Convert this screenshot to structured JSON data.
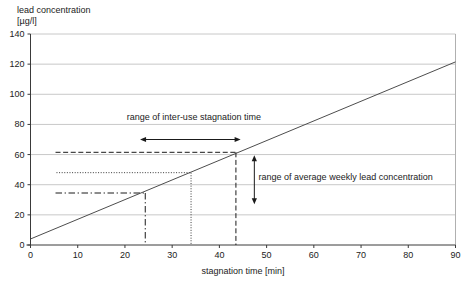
{
  "chart_data": {
    "type": "line",
    "title": "",
    "x_axis": {
      "label": "stagnation time [min]",
      "min": 0,
      "max": 90,
      "ticks": [
        0,
        10,
        20,
        30,
        40,
        50,
        60,
        70,
        80,
        90
      ]
    },
    "y_axis": {
      "label": "lead concentration",
      "unit_label": "[µg/l]",
      "min": 0,
      "max": 140,
      "ticks": [
        0,
        20,
        40,
        60,
        80,
        100,
        120,
        140
      ]
    },
    "grid": "horizontal-only",
    "legend": "none",
    "series": [
      {
        "name": "lead concentration vs stagnation time",
        "points": [
          {
            "x": 0,
            "y": 4
          },
          {
            "x": 90,
            "y": 121.5
          }
        ]
      }
    ],
    "reference_sets": [
      {
        "name": "lower-stagnation",
        "line_style": "dashdot",
        "stagnation_time_min": 24.3,
        "lead_concentration_ugl": 34.5,
        "x_start": 5.3
      },
      {
        "name": "middle-stagnation",
        "line_style": "dotted",
        "stagnation_time_min": 34.0,
        "lead_concentration_ugl": 48.0,
        "x_start": 5.5
      },
      {
        "name": "upper-stagnation",
        "line_style": "dashed",
        "stagnation_time_min": 43.5,
        "lead_concentration_ugl": 61.5,
        "x_start": 5.3
      }
    ],
    "annotations": [
      {
        "id": "inter_use",
        "text": "range of inter-use stagnation time",
        "x": 34.6,
        "y": 83,
        "anchor": "middle"
      },
      {
        "id": "weekly_lead",
        "text": "range of average weekly lead concentration",
        "x": 48.3,
        "y": 43,
        "anchor": "start"
      }
    ],
    "arrows": [
      {
        "id": "inter_use_arrow",
        "orientation": "horizontal",
        "y": 70,
        "x1": 23.2,
        "x2": 44.5
      },
      {
        "id": "weekly_lead_arrow",
        "orientation": "vertical",
        "x": 47.4,
        "y1": 27,
        "y2": 59.5
      }
    ]
  },
  "colors": {
    "background": "#ffffff",
    "gridline": "#c8c8c8",
    "plot_border": "#b0b0b0",
    "axis": "#3a3a3a",
    "series_line": "#4d4d4d",
    "reference_line": "#1a1a1a",
    "dotted_line": "#3a3a3a",
    "text": "#222222"
  }
}
